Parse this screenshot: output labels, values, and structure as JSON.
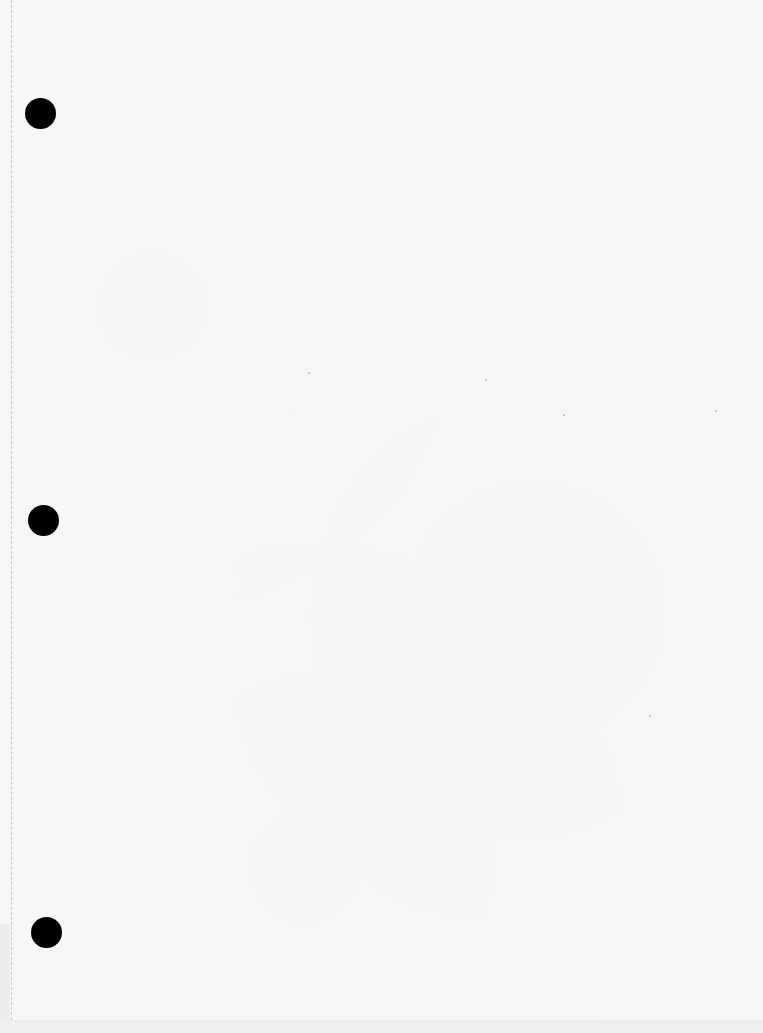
{
  "document": {
    "type": "scanned blank loose-leaf page",
    "text": "",
    "punch_holes": [
      {
        "name": "top",
        "x": 40,
        "y": 113
      },
      {
        "name": "middle",
        "x": 43,
        "y": 520
      },
      {
        "name": "bottom",
        "x": 46,
        "y": 932
      }
    ],
    "colors": {
      "paper": "#f8f8f8",
      "hole": "#000000",
      "perforation": "#bdbdbd"
    }
  }
}
